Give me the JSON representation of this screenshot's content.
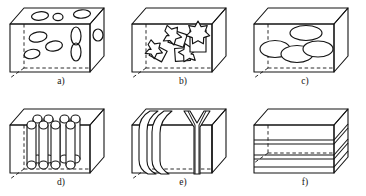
{
  "figure": {
    "title_visible": false,
    "background_color": "#ffffff",
    "line_color": "#141414",
    "panel_count": 6,
    "layout": "2 rows x 3 columns",
    "panels": [
      {
        "id": "a",
        "label": "a)",
        "content_description": "rectangular box containing small scattered ellipsoidal particles",
        "inclusion_shape": "ellipse",
        "inclusion_count": 11
      },
      {
        "id": "b",
        "label": "b)",
        "content_description": "rectangular box containing star-section prismatic rods at mixed orientations",
        "inclusion_shape": "star-prism",
        "inclusion_count": 4
      },
      {
        "id": "c",
        "label": "c)",
        "content_description": "rectangular box containing large flat overlapping disks",
        "inclusion_shape": "ellipse",
        "inclusion_count": 4
      },
      {
        "id": "d",
        "label": "d)",
        "content_description": "rectangular box containing vertical cylindrical fibers in rows",
        "inclusion_shape": "cylinder",
        "inclusion_count": 8
      },
      {
        "id": "e",
        "label": "e)",
        "content_description": "rectangular box containing vertical curved plates and sheets",
        "inclusion_shape": "curved-plate",
        "inclusion_count": 3
      },
      {
        "id": "f",
        "label": "f)",
        "content_description": "rectangular box containing horizontal stacked layers",
        "inclusion_shape": "layer",
        "inclusion_count": 3
      }
    ]
  }
}
